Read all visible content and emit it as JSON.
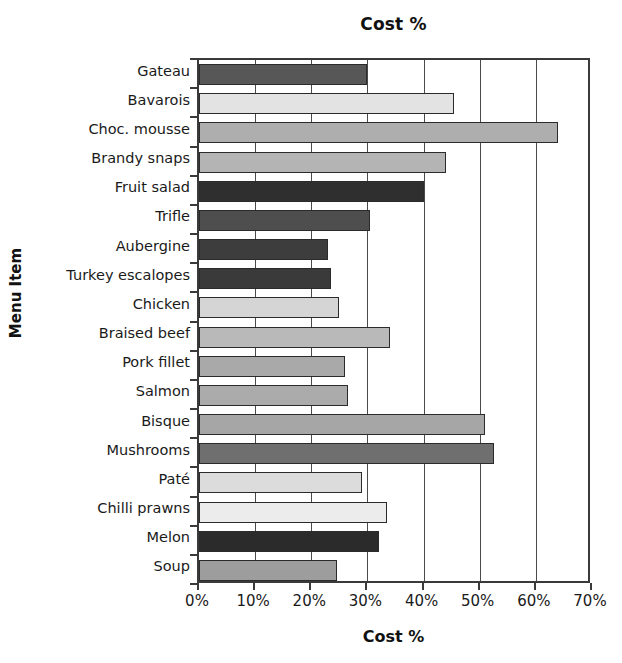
{
  "chart_data": {
    "type": "bar",
    "orientation": "horizontal",
    "title": "Cost %",
    "xlabel": "Cost %",
    "ylabel": "Menu Item",
    "xlim": [
      0,
      70
    ],
    "xticks": [
      "0%",
      "10%",
      "20%",
      "30%",
      "40%",
      "50%",
      "60%",
      "70%"
    ],
    "xtick_values": [
      0,
      10,
      20,
      30,
      40,
      50,
      60,
      70
    ],
    "grid": "vertical",
    "legend": "none",
    "categories": [
      "Gateau",
      "Bavarois",
      "Choc. mousse",
      "Brandy snaps",
      "Fruit salad",
      "Trifle",
      "Aubergine",
      "Turkey escalopes",
      "Chicken",
      "Braised beef",
      "Pork fillet",
      "Salmon",
      "Bisque",
      "Mushrooms",
      "Paté",
      "Chilli prawns",
      "Melon",
      "Soup"
    ],
    "values": [
      30,
      45.5,
      64,
      44,
      40,
      30.5,
      23,
      23.5,
      25,
      34,
      26,
      26.5,
      51,
      52.5,
      29,
      33.5,
      32,
      24.5
    ],
    "bar_colors": [
      "#575757",
      "#e3e3e3",
      "#aeaeae",
      "#b4b4b4",
      "#2f2f2f",
      "#4e4e4e",
      "#3d3d3d",
      "#3a3a3a",
      "#d5d5d5",
      "#b9b9b9",
      "#a9a9a9",
      "#ababab",
      "#a6a6a6",
      "#6f6f6f",
      "#dcdcdc",
      "#ececec",
      "#2b2b2b",
      "#9d9d9d"
    ]
  },
  "colors": {
    "axis": "#3a3a3a",
    "grid": "#4a4a4a",
    "text": "#1a1a1a",
    "background": "#ffffff",
    "bar_border": "#2b2b2b"
  }
}
